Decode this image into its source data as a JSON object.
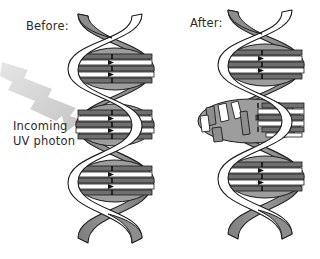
{
  "figure": {
    "title_hidden": "",
    "labels": {
      "before": "Before:",
      "after": "After:",
      "photon_line1": "Incoming",
      "photon_line2": "UV photon"
    },
    "icons": {
      "arrow": "uv-photon-arrow-icon",
      "helix_left": "dna-double-helix-before-icon",
      "helix_right": "dna-double-helix-after-icon",
      "lesion": "thymine-dimer-lesion-icon"
    },
    "colors": {
      "background": "#ffffff",
      "outline": "#1a1a1a",
      "backbone_shaded": "#8c8c8c",
      "backbone_light": "#ffffff",
      "basepair_dark": "#7a7a7a",
      "basepair_mid": "#a8a8a8",
      "basepair_light": "#ffffff",
      "arrow_gray": "#cfcfcf",
      "text": "#2b2b2b"
    },
    "structure": {
      "before_helix": {
        "turns": 3,
        "rungs_per_turn": 5,
        "damaged": false
      },
      "after_helix": {
        "turns": 3,
        "rungs_per_turn": 5,
        "damaged": true,
        "lesion_turn_index": 2,
        "lesion_description": "broken, displaced base pairs"
      }
    }
  }
}
